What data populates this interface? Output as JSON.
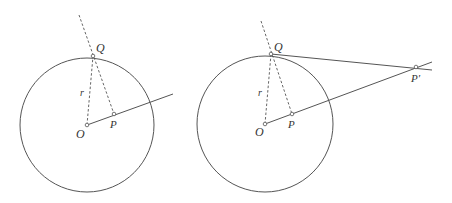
{
  "figures": [
    {
      "id": "left",
      "labels": {
        "Q": "Q",
        "r": "r",
        "O": "O",
        "P": "P"
      }
    },
    {
      "id": "right",
      "labels": {
        "Q": "Q",
        "r": "r",
        "O": "O",
        "P": "P",
        "Pprime": "P′"
      }
    }
  ],
  "colors": {
    "stroke": "#555555",
    "text": "#333333"
  }
}
